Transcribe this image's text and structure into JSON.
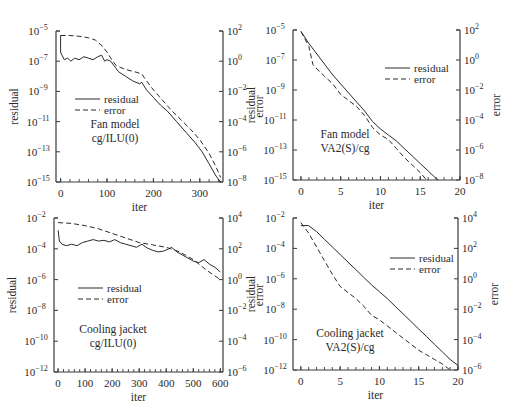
{
  "colors": {
    "line": "#2a2a2a",
    "axis": "#3a3a3a",
    "background": "#ffffff"
  },
  "chart_data": [
    {
      "type": "line",
      "id": "fan-ilu",
      "panel": {
        "left": 56,
        "top": 31,
        "right": 223,
        "bottom": 182
      },
      "annotation": [
        "Fan model",
        "cg/ILU(0)"
      ],
      "annotation_pos": [
        115,
        128
      ],
      "legend": {
        "entries": [
          "residual",
          "error"
        ],
        "x": 75,
        "y": 99
      },
      "xlabel": "iter",
      "ylabel_left": "residual",
      "ylabel_right": "error",
      "xlim": [
        -10,
        350
      ],
      "xticks": [
        0,
        100,
        200,
        300
      ],
      "xminor_step": 20,
      "ylim_left_exp": [
        -15,
        -5
      ],
      "yticks_left": [
        "10^-5",
        "10^-7",
        "10^-9",
        "10^-11",
        "10^-13",
        "10^-15"
      ],
      "yticks_left_exp": [
        -5,
        -7,
        -9,
        -11,
        -13,
        -15
      ],
      "ylim_right_exp": [
        -8,
        2
      ],
      "yticks_right_exp": [
        2,
        0,
        -2,
        -4,
        -6,
        -8
      ],
      "series": [
        {
          "name": "residual",
          "style": "solid",
          "axis": "left",
          "x": [
            -1,
            0,
            0,
            3,
            8,
            15,
            22,
            30,
            40,
            50,
            60,
            70,
            80,
            88,
            95,
            100,
            108,
            115,
            125,
            140,
            155,
            170,
            175,
            185,
            200,
            215,
            230,
            250,
            270,
            290,
            305,
            320,
            335,
            345
          ],
          "y": [
            -5.3,
            -5.3,
            -6.4,
            -6.6,
            -6.9,
            -6.8,
            -7.0,
            -6.8,
            -6.9,
            -6.7,
            -6.8,
            -6.9,
            -6.7,
            -6.6,
            -7.0,
            -6.9,
            -7.0,
            -7.3,
            -7.7,
            -8.0,
            -8.3,
            -8.5,
            -8.4,
            -8.9,
            -9.4,
            -9.9,
            -10.3,
            -11.0,
            -11.7,
            -12.4,
            -13.0,
            -13.8,
            -14.6,
            -15.0
          ]
        },
        {
          "name": "error",
          "style": "dashed",
          "axis": "right",
          "x": [
            0,
            20,
            40,
            60,
            75,
            90,
            100,
            110,
            120,
            140,
            160,
            175,
            185,
            200,
            220,
            240,
            260,
            280,
            300,
            320,
            335,
            345
          ],
          "y": [
            1.7,
            1.7,
            1.65,
            1.55,
            1.4,
            1.0,
            0.6,
            0.1,
            -0.3,
            -0.55,
            -0.7,
            -0.85,
            -1.3,
            -1.9,
            -2.6,
            -3.3,
            -3.9,
            -4.5,
            -5.2,
            -6.1,
            -7.0,
            -7.7
          ]
        }
      ]
    },
    {
      "type": "line",
      "id": "fan-va2",
      "panel": {
        "left": 293,
        "top": 30,
        "right": 460,
        "bottom": 180
      },
      "annotation": [
        "Fan model",
        "VA2(S)/cg"
      ],
      "annotation_pos": [
        345,
        138
      ],
      "legend": {
        "entries": [
          "residual",
          "error"
        ],
        "x": 385,
        "y": 68
      },
      "xlabel": "iter",
      "ylabel_left": "residual",
      "ylabel_right": "error",
      "xlim": [
        -1,
        20
      ],
      "xticks": [
        0,
        5,
        10,
        15,
        20
      ],
      "xminor_step": 1,
      "ylim_left_exp": [
        -15,
        -5
      ],
      "yticks_left": [
        "10^-5",
        "10^-7",
        "10^-9",
        "10^-11",
        "10^-13",
        "10^-15"
      ],
      "yticks_left_exp": [
        -5,
        -7,
        -9,
        -11,
        -13,
        -15
      ],
      "ylim_right_exp": [
        -8,
        2
      ],
      "yticks_right_exp": [
        2,
        0,
        -2,
        -4,
        -6,
        -8
      ],
      "series": [
        {
          "name": "residual",
          "style": "solid",
          "axis": "left",
          "x": [
            0,
            1,
            2,
            3,
            4,
            5,
            6,
            7,
            8,
            9,
            10,
            11,
            12,
            13,
            14,
            15,
            16,
            17,
            17.3
          ],
          "y": [
            -5.1,
            -5.9,
            -6.6,
            -7.3,
            -8.0,
            -8.6,
            -9.2,
            -9.8,
            -10.4,
            -11.1,
            -11.6,
            -12.0,
            -12.4,
            -12.9,
            -13.4,
            -13.9,
            -14.4,
            -14.9,
            -15.0
          ]
        },
        {
          "name": "error",
          "style": "dashed",
          "axis": "right",
          "x": [
            0,
            1,
            1.5,
            2,
            3,
            4,
            5,
            6,
            7,
            8,
            9,
            10,
            11,
            12,
            13,
            14,
            15,
            15.8
          ],
          "y": [
            1.9,
            0.9,
            -0.3,
            -0.6,
            -1.1,
            -1.6,
            -2.3,
            -2.7,
            -3.1,
            -3.7,
            -4.5,
            -5.0,
            -5.3,
            -5.9,
            -6.5,
            -7.0,
            -7.5,
            -8.0
          ]
        }
      ]
    },
    {
      "type": "line",
      "id": "jacket-ilu",
      "panel": {
        "left": 54,
        "top": 218,
        "right": 223,
        "bottom": 372
      },
      "annotation": [
        "Cooling jacket",
        "cg/ILU(0)"
      ],
      "annotation_pos": [
        113,
        333
      ],
      "legend": {
        "entries": [
          "residual",
          "error"
        ],
        "x": 78,
        "y": 288
      },
      "xlabel": "iter",
      "ylabel_left": "residual",
      "ylabel_right": "error",
      "xlim": [
        -15,
        610
      ],
      "xticks": [
        0,
        100,
        200,
        300,
        400,
        500,
        600
      ],
      "xminor_step": 20,
      "ylim_left_exp": [
        -12,
        -2
      ],
      "yticks_left": [
        "10^-2",
        "10^-4",
        "10^-6",
        "10^-8",
        "10^-10",
        "10^-12"
      ],
      "yticks_left_exp": [
        -2,
        -4,
        -6,
        -8,
        -10,
        -12
      ],
      "ylim_right_exp": [
        -6,
        4
      ],
      "yticks_right_exp": [
        4,
        2,
        0,
        -2,
        -4,
        -6
      ],
      "series": [
        {
          "name": "residual",
          "style": "solid",
          "axis": "left",
          "x": [
            0,
            5,
            15,
            30,
            50,
            70,
            90,
            110,
            130,
            150,
            170,
            190,
            210,
            230,
            250,
            270,
            290,
            310,
            330,
            350,
            370,
            390,
            410,
            420,
            440,
            460,
            480,
            500,
            520,
            540,
            560,
            580,
            600
          ],
          "y": [
            -2.8,
            -3.5,
            -3.7,
            -3.8,
            -3.7,
            -3.8,
            -3.6,
            -3.5,
            -3.4,
            -3.5,
            -3.45,
            -3.55,
            -3.4,
            -3.6,
            -3.7,
            -3.8,
            -3.9,
            -3.7,
            -3.95,
            -4.1,
            -4.2,
            -4.15,
            -4.0,
            -3.9,
            -4.2,
            -4.4,
            -4.6,
            -4.8,
            -4.9,
            -4.7,
            -5.0,
            -5.2,
            -5.5
          ]
        },
        {
          "name": "error",
          "style": "dashed",
          "axis": "right",
          "x": [
            0,
            50,
            100,
            150,
            200,
            250,
            300,
            350,
            400,
            450,
            500,
            550,
            600
          ],
          "y": [
            3.7,
            3.65,
            3.5,
            3.3,
            3.0,
            2.7,
            2.4,
            2.25,
            2.1,
            1.8,
            1.3,
            0.6,
            0.0
          ]
        }
      ]
    },
    {
      "type": "line",
      "id": "jacket-va2",
      "panel": {
        "left": 293,
        "top": 218,
        "right": 458,
        "bottom": 370
      },
      "annotation": [
        "Cooling jacket",
        "VA2(S)/cg"
      ],
      "annotation_pos": [
        350,
        337
      ],
      "legend": {
        "entries": [
          "residual",
          "error"
        ],
        "x": 390,
        "y": 258
      },
      "xlabel": "iter",
      "ylabel_left": "residual",
      "ylabel_right": "error",
      "xlim": [
        -1,
        20
      ],
      "xticks": [
        0,
        5,
        10,
        15,
        20
      ],
      "xminor_step": 1,
      "ylim_left_exp": [
        -12,
        -2
      ],
      "yticks_left": [
        "10^-2",
        "10^-4",
        "10^-6",
        "10^-8",
        "10^-10",
        "10^-12"
      ],
      "yticks_left_exp": [
        -2,
        -4,
        -6,
        -8,
        -10,
        -12
      ],
      "ylim_right_exp": [
        -6,
        4
      ],
      "yticks_right_exp": [
        4,
        2,
        0,
        -2,
        -4,
        -6
      ],
      "series": [
        {
          "name": "residual",
          "style": "solid",
          "axis": "left",
          "x": [
            0,
            1,
            2,
            3,
            4,
            5,
            6,
            7,
            8,
            9,
            10,
            11,
            12,
            13,
            14,
            15,
            16,
            17,
            18,
            19,
            20
          ],
          "y": [
            -2.5,
            -2.5,
            -2.9,
            -3.4,
            -3.9,
            -4.4,
            -4.9,
            -5.4,
            -5.9,
            -6.4,
            -6.85,
            -7.3,
            -7.8,
            -8.3,
            -8.8,
            -9.3,
            -9.8,
            -10.3,
            -10.8,
            -11.3,
            -11.7
          ]
        },
        {
          "name": "error",
          "style": "dashed",
          "axis": "right",
          "x": [
            0,
            1,
            2,
            3,
            4,
            5,
            6,
            7,
            8,
            9,
            10,
            11,
            12,
            13,
            14,
            15,
            16,
            17,
            18,
            19
          ],
          "y": [
            3.7,
            3.0,
            2.1,
            1.2,
            0.3,
            -0.5,
            -0.9,
            -1.3,
            -1.8,
            -2.4,
            -2.7,
            -3.1,
            -3.5,
            -3.9,
            -4.3,
            -4.7,
            -5.0,
            -5.3,
            -5.6,
            -6.0
          ]
        }
      ]
    }
  ]
}
